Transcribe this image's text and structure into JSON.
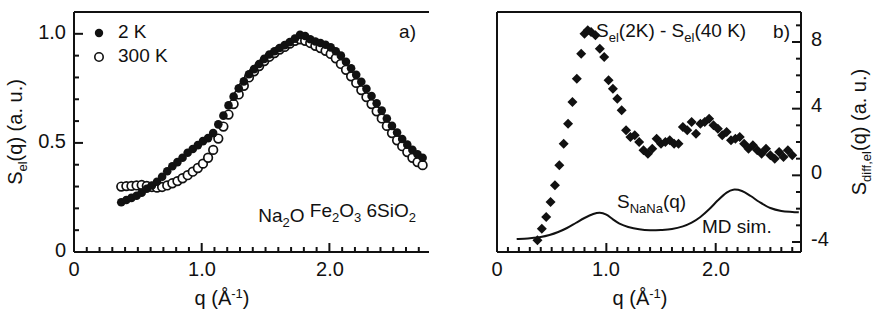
{
  "figure": {
    "panels": [
      "a)",
      "b)"
    ],
    "background": "#ffffff",
    "ink": "#111111"
  },
  "panel_a": {
    "label": "a)",
    "xlabel_main": "q",
    "xlabel_unit_open": "(",
    "xlabel_unit_angstrom": "Å",
    "xlabel_unit_exp": "-1",
    "xlabel_unit_close": ")",
    "ylabel_main": "S",
    "ylabel_sub": "el",
    "ylabel_rest": "(q)  (a. u.)",
    "xticks": [
      "0",
      "1.0",
      "2.0"
    ],
    "yticks": [
      "0",
      "0.5",
      "1.0"
    ],
    "legend": [
      {
        "marker": "filled-circle",
        "label": "2 K"
      },
      {
        "marker": "open-circle",
        "label": "300 K"
      }
    ],
    "sample_formula": "Na2O Fe2O3 6SiO2",
    "sample_formula_parts": [
      {
        "t": "Na",
        "s": "base"
      },
      {
        "t": "2",
        "s": "sub"
      },
      {
        "t": "O ",
        "s": "base"
      },
      {
        "t": "Fe",
        "s": "base"
      },
      {
        "t": "2",
        "s": "sub"
      },
      {
        "t": "O",
        "s": "base"
      },
      {
        "t": "3",
        "s": "sub"
      },
      {
        "t": " 6SiO",
        "s": "base"
      },
      {
        "t": "2",
        "s": "sub"
      }
    ]
  },
  "panel_b": {
    "label": "b)",
    "xlabel_main": "q",
    "xlabel_unit_open": "(",
    "xlabel_unit_angstrom": "Å",
    "xlabel_unit_exp": "-1",
    "xlabel_unit_close": ")",
    "ylabel_main": "S",
    "ylabel_sub": "diff,el",
    "ylabel_rest": "(q)  (a. u.)",
    "xticks": [
      "0",
      "1.0",
      "2.0"
    ],
    "yticks": [
      "-4",
      "0",
      "4",
      "8"
    ],
    "annotation_diff_parts": [
      {
        "t": "S",
        "s": "base"
      },
      {
        "t": "el",
        "s": "sub"
      },
      {
        "t": "(2K) - S",
        "s": "base"
      },
      {
        "t": "el",
        "s": "sub"
      },
      {
        "t": "(40 K)",
        "s": "base"
      }
    ],
    "annotation_diff_plain": "Sel(2K) - Sel(40 K)",
    "annotation_nana_parts": [
      {
        "t": "S",
        "s": "base"
      },
      {
        "t": "NaNa",
        "s": "sub"
      },
      {
        "t": "(q)",
        "s": "base"
      }
    ],
    "annotation_nana_plain": "SNaNa(q)",
    "annotation_md": "MD sim."
  },
  "chart_data": [
    {
      "type": "scatter",
      "panel": "a)",
      "title": "",
      "xlabel": "q (Å-1)",
      "ylabel": "Sel(q) (a. u.)",
      "xlim": [
        0,
        2.78
      ],
      "ylim": [
        0,
        1.1
      ],
      "xticks": [
        0,
        1.0,
        2.0
      ],
      "yticks": [
        0,
        0.5,
        1.0
      ],
      "grid": false,
      "legend_position": "top-left",
      "annotations": [
        "Na2O Fe2O3 6SiO2"
      ],
      "series": [
        {
          "name": "2 K",
          "marker": "filled-circle",
          "x": [
            0.37,
            0.41,
            0.45,
            0.49,
            0.53,
            0.57,
            0.61,
            0.65,
            0.69,
            0.73,
            0.77,
            0.81,
            0.85,
            0.89,
            0.93,
            0.97,
            1.01,
            1.05,
            1.09,
            1.13,
            1.17,
            1.21,
            1.25,
            1.29,
            1.33,
            1.37,
            1.41,
            1.45,
            1.49,
            1.53,
            1.57,
            1.61,
            1.65,
            1.69,
            1.73,
            1.77,
            1.81,
            1.85,
            1.89,
            1.93,
            1.97,
            2.01,
            2.05,
            2.09,
            2.13,
            2.17,
            2.21,
            2.25,
            2.29,
            2.33,
            2.37,
            2.41,
            2.45,
            2.49,
            2.53,
            2.57,
            2.61,
            2.65,
            2.69,
            2.73
          ],
          "y": [
            0.228,
            0.238,
            0.248,
            0.258,
            0.272,
            0.29,
            0.305,
            0.322,
            0.345,
            0.37,
            0.393,
            0.412,
            0.432,
            0.455,
            0.472,
            0.49,
            0.508,
            0.522,
            0.545,
            0.585,
            0.625,
            0.672,
            0.712,
            0.75,
            0.782,
            0.815,
            0.838,
            0.862,
            0.885,
            0.905,
            0.92,
            0.935,
            0.948,
            0.962,
            0.978,
            0.995,
            0.99,
            0.975,
            0.965,
            0.958,
            0.95,
            0.938,
            0.92,
            0.9,
            0.872,
            0.842,
            0.812,
            0.78,
            0.748,
            0.715,
            0.682,
            0.648,
            0.612,
            0.578,
            0.548,
            0.518,
            0.492,
            0.468,
            0.448,
            0.432
          ]
        },
        {
          "name": "300 K",
          "marker": "open-circle",
          "x": [
            0.37,
            0.41,
            0.45,
            0.49,
            0.53,
            0.57,
            0.61,
            0.65,
            0.69,
            0.73,
            0.77,
            0.81,
            0.85,
            0.89,
            0.93,
            0.97,
            1.01,
            1.05,
            1.09,
            1.13,
            1.17,
            1.21,
            1.25,
            1.29,
            1.33,
            1.37,
            1.41,
            1.45,
            1.49,
            1.53,
            1.57,
            1.61,
            1.65,
            1.69,
            1.73,
            1.77,
            1.81,
            1.85,
            1.89,
            1.93,
            1.97,
            2.01,
            2.05,
            2.09,
            2.13,
            2.17,
            2.21,
            2.25,
            2.29,
            2.33,
            2.37,
            2.41,
            2.45,
            2.49,
            2.53,
            2.57,
            2.61,
            2.65,
            2.69,
            2.73
          ],
          "y": [
            0.3,
            0.302,
            0.303,
            0.305,
            0.307,
            0.303,
            0.298,
            0.295,
            0.298,
            0.305,
            0.315,
            0.325,
            0.338,
            0.352,
            0.368,
            0.385,
            0.405,
            0.432,
            0.468,
            0.52,
            0.575,
            0.63,
            0.678,
            0.722,
            0.762,
            0.8,
            0.828,
            0.852,
            0.875,
            0.895,
            0.912,
            0.928,
            0.94,
            0.955,
            0.968,
            0.975,
            0.968,
            0.958,
            0.945,
            0.935,
            0.922,
            0.908,
            0.888,
            0.862,
            0.835,
            0.805,
            0.775,
            0.742,
            0.71,
            0.678,
            0.645,
            0.612,
            0.578,
            0.545,
            0.512,
            0.485,
            0.458,
            0.432,
            0.412,
            0.398
          ]
        }
      ]
    },
    {
      "type": "scatter",
      "panel": "b)",
      "title": "",
      "xlabel": "q (Å-1)",
      "ylabel": "Sdiff,el(q) (a. u.)",
      "xlim": [
        0,
        2.78
      ],
      "ylim": [
        -4.6,
        9.8
      ],
      "xticks": [
        0,
        1.0,
        2.0
      ],
      "yticks": [
        -4,
        0,
        4,
        8
      ],
      "grid": false,
      "annotations": [
        "Sel(2K) - Sel(40 K)",
        "SNaNa(q)",
        "MD sim."
      ],
      "series": [
        {
          "name": "Sel(2K) - Sel(40 K)",
          "marker": "filled-diamond",
          "x": [
            0.37,
            0.41,
            0.45,
            0.49,
            0.53,
            0.57,
            0.61,
            0.65,
            0.69,
            0.73,
            0.77,
            0.8,
            0.83,
            0.86,
            0.9,
            0.94,
            0.98,
            1.02,
            1.06,
            1.1,
            1.14,
            1.18,
            1.22,
            1.26,
            1.3,
            1.34,
            1.38,
            1.42,
            1.46,
            1.5,
            1.54,
            1.58,
            1.62,
            1.66,
            1.7,
            1.74,
            1.78,
            1.82,
            1.86,
            1.9,
            1.94,
            1.98,
            2.02,
            2.06,
            2.1,
            2.14,
            2.18,
            2.22,
            2.26,
            2.3,
            2.34,
            2.38,
            2.42,
            2.46,
            2.5,
            2.54,
            2.58,
            2.62,
            2.66,
            2.7
          ],
          "y": [
            -3.9,
            -3.2,
            -2.5,
            -1.6,
            -0.6,
            0.6,
            1.9,
            3.1,
            4.4,
            5.8,
            7.3,
            8.5,
            8.7,
            8.6,
            8.4,
            7.6,
            7.1,
            5.7,
            5.2,
            4.6,
            3.9,
            2.7,
            2.3,
            2.4,
            2.0,
            1.5,
            1.3,
            1.6,
            2.2,
            1.9,
            2.0,
            2.1,
            1.9,
            1.9,
            2.9,
            2.7,
            3.2,
            2.5,
            3.1,
            3.2,
            3.4,
            3.0,
            2.8,
            2.4,
            2.6,
            2.1,
            2.2,
            2.3,
            1.9,
            1.6,
            1.8,
            1.5,
            1.3,
            1.6,
            1.2,
            1.0,
            1.4,
            1.1,
            1.5,
            1.2
          ]
        },
        {
          "name": "SNaNa(q)",
          "marker": "line",
          "x": [
            0.18,
            0.25,
            0.32,
            0.4,
            0.48,
            0.56,
            0.64,
            0.72,
            0.8,
            0.88,
            0.94,
            1.0,
            1.06,
            1.12,
            1.2,
            1.3,
            1.4,
            1.5,
            1.6,
            1.7,
            1.78,
            1.86,
            1.94,
            2.02,
            2.1,
            2.16,
            2.24,
            2.32,
            2.4,
            2.5,
            2.6,
            2.7,
            2.76
          ],
          "y": [
            -3.82,
            -3.8,
            -3.76,
            -3.7,
            -3.58,
            -3.4,
            -3.16,
            -2.86,
            -2.56,
            -2.32,
            -2.24,
            -2.36,
            -2.64,
            -2.9,
            -3.1,
            -3.24,
            -3.3,
            -3.28,
            -3.22,
            -3.06,
            -2.84,
            -2.5,
            -2.04,
            -1.5,
            -1.04,
            -0.86,
            -0.94,
            -1.24,
            -1.6,
            -1.96,
            -2.14,
            -2.2,
            -2.22
          ]
        }
      ]
    }
  ]
}
